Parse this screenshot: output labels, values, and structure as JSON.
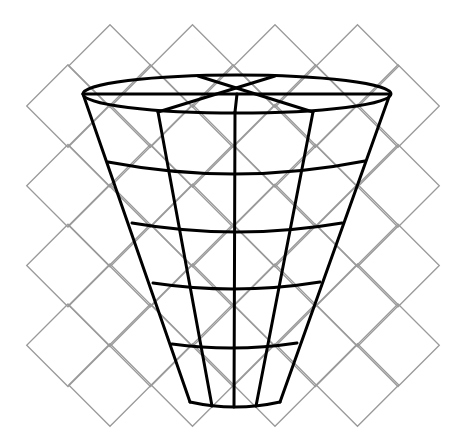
{
  "diagram": {
    "title": "",
    "colors": {
      "background": "#ffffff",
      "grid": "#9a9a9a",
      "cone": "#000000"
    },
    "grid": {
      "half_size": 41.3,
      "rows": [
        {
          "y": 66,
          "x": [
            110,
            192.5,
            275,
            357.5
          ]
        },
        {
          "y": 106,
          "x": [
            68,
            150.5,
            233,
            315.5,
            398
          ]
        },
        {
          "y": 145.75,
          "x": [
            110,
            192.5,
            275,
            357.5
          ]
        },
        {
          "y": 185.75,
          "x": [
            68,
            150.5,
            233,
            315.5,
            398
          ]
        },
        {
          "y": 225.5,
          "x": [
            110,
            192.5,
            275,
            357.5
          ]
        },
        {
          "y": 265.5,
          "x": [
            68,
            150.5,
            233,
            315.5,
            398
          ]
        },
        {
          "y": 305.25,
          "x": [
            110,
            192.5,
            275,
            357.5
          ]
        },
        {
          "y": 345.25,
          "x": [
            68,
            150.5,
            233,
            315.5,
            398
          ]
        },
        {
          "y": 385,
          "x": [
            110,
            192.5,
            275,
            357.5
          ]
        }
      ]
    },
    "cone": {
      "top_ellipse": {
        "cx": 237,
        "cy": 94,
        "rx": 154,
        "ry": 19
      },
      "spokes": [
        {
          "from": [
            83,
            94
          ],
          "to": [
            390,
            94
          ]
        },
        {
          "from": [
            198,
            76
          ],
          "to": [
            313,
            112
          ]
        },
        {
          "from": [
            275,
            76
          ],
          "to": [
            158,
            112
          ]
        },
        {
          "from": [
            237,
            94
          ],
          "to": [
            235,
            112
          ]
        }
      ],
      "meridians": [
        {
          "name": "left-outline",
          "from": [
            83,
            94
          ],
          "to": [
            190,
            402
          ]
        },
        {
          "name": "meridian-2",
          "from": [
            158,
            112
          ],
          "to": [
            212,
            406
          ]
        },
        {
          "name": "meridian-3",
          "from": [
            235,
            112
          ],
          "to": [
            234,
            407
          ]
        },
        {
          "name": "meridian-4",
          "from": [
            313,
            112
          ],
          "to": [
            256,
            406
          ]
        },
        {
          "name": "right-outline",
          "from": [
            390,
            94
          ],
          "to": [
            280,
            402
          ]
        }
      ],
      "rings": [
        {
          "left": [
            108,
            162
          ],
          "mid_y": 174,
          "right": [
            365,
            161
          ]
        },
        {
          "left": [
            132,
            223
          ],
          "mid_y": 232,
          "right": [
            342,
            223
          ]
        },
        {
          "left": [
            153,
            283
          ],
          "mid_y": 289,
          "right": [
            320,
            282
          ]
        },
        {
          "left": [
            172,
            344
          ],
          "mid_y": 348,
          "right": [
            297,
            343
          ]
        },
        {
          "left": [
            190,
            402
          ],
          "mid_y": 407,
          "right": [
            280,
            402
          ]
        }
      ]
    }
  }
}
